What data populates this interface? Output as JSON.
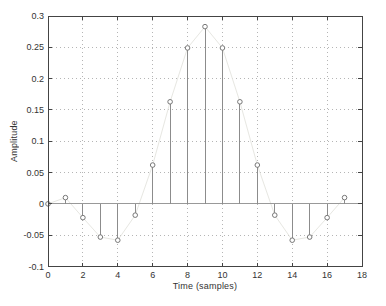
{
  "figure": {
    "background": "#ffffff"
  },
  "chart_data": {
    "type": "stem",
    "xlabel": "Time (samples)",
    "ylabel": "Amplitude",
    "x": [
      0,
      1,
      2,
      3,
      4,
      5,
      6,
      7,
      8,
      9,
      10,
      11,
      12,
      13,
      14,
      15,
      16,
      17
    ],
    "values": [
      0,
      0.01,
      -0.022,
      -0.053,
      -0.058,
      -0.018,
      0.062,
      0.163,
      0.249,
      0.283,
      0.249,
      0.163,
      0.062,
      -0.018,
      -0.058,
      -0.053,
      -0.022,
      0.01
    ],
    "xlim": [
      0,
      18
    ],
    "ylim": [
      -0.1,
      0.3
    ],
    "xticks": [
      0,
      2,
      4,
      6,
      8,
      10,
      12,
      14,
      16,
      18
    ],
    "xtick_labels": [
      "0",
      "2",
      "4",
      "6",
      "8",
      "10",
      "12",
      "14",
      "16",
      "18"
    ],
    "yticks": [
      -0.1,
      -0.05,
      0,
      0.05,
      0.1,
      0.15,
      0.2,
      0.25,
      0.3
    ],
    "ytick_labels": [
      "-0.1",
      "-0.05",
      "0",
      "0.05",
      "0.1",
      "0.15",
      "0.2",
      "0.25",
      "0.3"
    ],
    "grid": true,
    "baseline_y": 0,
    "marker": "open-circle",
    "legend": null,
    "colors": {
      "axis": "#444444",
      "text": "#333333",
      "grid": "#b5b5b5",
      "stem": "#8c8c8c",
      "marker": "#777777",
      "marker_fill": "#ffffff",
      "baseline": "#999999",
      "faint_line": "#e7e7e2"
    }
  }
}
